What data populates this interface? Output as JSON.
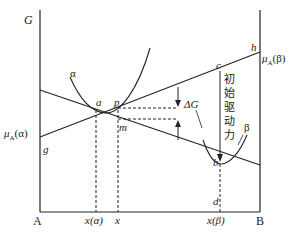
{
  "diagram": {
    "type": "free-energy-composition-diagram",
    "axis": {
      "y_label": "G",
      "left_end": "A",
      "right_end": "B"
    },
    "points": {
      "a": "a",
      "p": "p",
      "m": "m",
      "g": "g",
      "h": "h",
      "c": "c",
      "b": "b",
      "d": "d"
    },
    "curves": {
      "alpha": "α",
      "beta": "β"
    },
    "intercepts": {
      "mu_alpha": "μA(α)",
      "mu_alpha_sym": "μ",
      "mu_alpha_sub": "A",
      "mu_alpha_phase": "(α)",
      "mu_beta_sym": "μ",
      "mu_beta_sub": "A",
      "mu_beta_phase": "(β)"
    },
    "annotations": {
      "delta_g": "ΔG",
      "driving_force_chars": [
        "初",
        "始",
        "驱",
        "动",
        "力"
      ]
    },
    "x_ticks": {
      "x_alpha": "x(α)",
      "x": "x",
      "x_beta": "x(β)"
    }
  }
}
